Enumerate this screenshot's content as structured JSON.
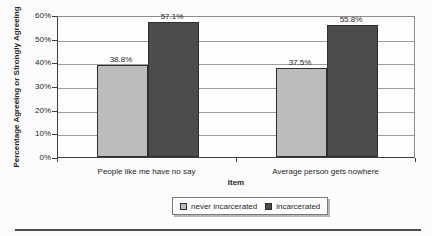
{
  "chart_data": {
    "type": "bar",
    "title": "",
    "xlabel": "Item",
    "ylabel": "Percentage Agreeing or Strongly Agreeing",
    "categories": [
      "People like me have no say",
      "Average person gets nowhere"
    ],
    "series": [
      {
        "name": "never incarcerated",
        "color": "#bcbcbc",
        "values": [
          38.8,
          37.5
        ],
        "labels": [
          "38.8%",
          "37.5%"
        ]
      },
      {
        "name": "incarcerated",
        "color": "#4c4c4c",
        "values": [
          57.1,
          55.8
        ],
        "labels": [
          "57.1%",
          "55.8%"
        ]
      }
    ],
    "ylim": [
      0,
      60
    ],
    "ytick_step": 10,
    "ytick_labels": [
      "0%",
      "10%",
      "20%",
      "30%",
      "40%",
      "50%",
      "60%"
    ],
    "grid": true,
    "legend_position": "bottom"
  }
}
